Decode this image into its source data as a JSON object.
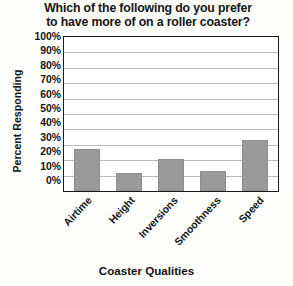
{
  "chart_data": {
    "type": "bar",
    "title": "Which of the following do you prefer to have more of on a roller coaster?",
    "title_line1": "Which of the following do you prefer",
    "title_line2": "to have more of on a roller coaster?",
    "xlabel": "Coaster Qualities",
    "ylabel": "Percent Responding",
    "categories": [
      "Airtime",
      "Height",
      "Inversions",
      "Smoothness",
      "Speed"
    ],
    "values": [
      27,
      12,
      21,
      13,
      33
    ],
    "ylim": [
      0,
      100
    ],
    "ytick_labels": [
      "100%",
      "90%",
      "80%",
      "70%",
      "60%",
      "50%",
      "40%",
      "30%",
      "20%",
      "10%",
      "0%"
    ],
    "ytick_values": [
      100,
      90,
      80,
      70,
      60,
      50,
      40,
      30,
      20,
      10,
      0
    ],
    "grid": true,
    "grid_axis": "y",
    "legend": false,
    "bar_color": "#9a9a9a",
    "axis_color": "#1a1a1a",
    "grid_color": "#b9b9b9",
    "background": "#ffffff"
  }
}
